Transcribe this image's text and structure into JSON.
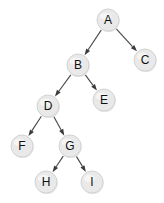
{
  "figure": {
    "kind": "binary-tree-diagram",
    "width": 164,
    "height": 203,
    "background_color": "#ffffff"
  },
  "style": {
    "node_fill": "#e9e9e9",
    "node_stroke": "#cfcfcf",
    "node_highlight": "#f5f5f5",
    "node_shadow": "#d2d2d2",
    "label_color": "#101010",
    "edge_color": "#4a4a4a",
    "arrowhead_color": "#3a3a3a",
    "node_radius": 11
  },
  "nodes": [
    {
      "id": "A",
      "label": "A",
      "cx": 108,
      "cy": 20,
      "r": 11
    },
    {
      "id": "B",
      "label": "B",
      "cx": 78,
      "cy": 65,
      "r": 11
    },
    {
      "id": "C",
      "label": "C",
      "cx": 145,
      "cy": 60,
      "r": 11
    },
    {
      "id": "D",
      "label": "D",
      "cx": 48,
      "cy": 106,
      "r": 11
    },
    {
      "id": "E",
      "label": "E",
      "cx": 104,
      "cy": 100,
      "r": 11
    },
    {
      "id": "F",
      "label": "F",
      "cx": 22,
      "cy": 146,
      "r": 11
    },
    {
      "id": "G",
      "label": "G",
      "cx": 70,
      "cy": 146,
      "r": 11
    },
    {
      "id": "H",
      "label": "H",
      "cx": 46,
      "cy": 182,
      "r": 11
    },
    {
      "id": "I",
      "label": "I",
      "cx": 92,
      "cy": 182,
      "r": 11
    }
  ],
  "edges": [
    {
      "id": "A-B",
      "from": "A",
      "to": "B",
      "side": "left",
      "directed": true
    },
    {
      "id": "A-C",
      "from": "A",
      "to": "C",
      "side": "right",
      "directed": true
    },
    {
      "id": "B-D",
      "from": "B",
      "to": "D",
      "side": "left",
      "directed": true
    },
    {
      "id": "B-E",
      "from": "B",
      "to": "E",
      "side": "right",
      "directed": true
    },
    {
      "id": "D-F",
      "from": "D",
      "to": "F",
      "side": "left",
      "directed": true
    },
    {
      "id": "D-G",
      "from": "D",
      "to": "G",
      "side": "right",
      "directed": true
    },
    {
      "id": "G-H",
      "from": "G",
      "to": "H",
      "side": "left",
      "directed": true
    },
    {
      "id": "G-I",
      "from": "G",
      "to": "I",
      "side": "right",
      "directed": true
    }
  ]
}
